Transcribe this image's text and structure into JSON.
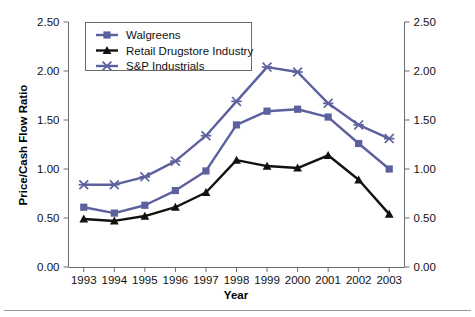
{
  "chart_data": {
    "type": "line",
    "title": "",
    "xlabel": "Year",
    "ylabel": "Price/Cash Flow Ratio",
    "categories": [
      "1993",
      "1994",
      "1995",
      "1996",
      "1997",
      "1998",
      "1999",
      "2000",
      "2001",
      "2002",
      "2003"
    ],
    "x": [
      1993,
      1994,
      1995,
      1996,
      1997,
      1998,
      1999,
      2000,
      2001,
      2002,
      2003
    ],
    "ylim": [
      0.0,
      2.5
    ],
    "yticks": [
      "0.00",
      "0.50",
      "1.00",
      "1.50",
      "2.00",
      "2.50"
    ],
    "ytick_values": [
      0.0,
      0.5,
      1.0,
      1.5,
      2.0,
      2.5
    ],
    "right_axis": true,
    "right_yticks": [
      "0.00",
      "0.50",
      "1.00",
      "1.50",
      "2.00",
      "2.50"
    ],
    "grid": false,
    "legend_position": "top-left",
    "series": [
      {
        "name": "Walgreens",
        "marker": "square",
        "color": "#5c619e",
        "values": [
          0.61,
          0.55,
          0.63,
          0.78,
          0.98,
          1.45,
          1.59,
          1.61,
          1.53,
          1.26,
          1.0
        ]
      },
      {
        "name": "Retail Drugstore Industry",
        "marker": "triangle",
        "color": "#111111",
        "values": [
          0.49,
          0.47,
          0.52,
          0.61,
          0.76,
          1.09,
          1.03,
          1.01,
          1.14,
          0.89,
          0.54
        ]
      },
      {
        "name": "S&P Industrials",
        "marker": "x",
        "color": "#5c619e",
        "values": [
          0.84,
          0.84,
          0.92,
          1.08,
          1.34,
          1.69,
          2.04,
          1.99,
          1.67,
          1.45,
          1.31
        ]
      }
    ]
  },
  "legend": {
    "entries": [
      {
        "label": "Walgreens"
      },
      {
        "label": "Retail Drugstore Industry"
      },
      {
        "label": "S&P Industrials"
      }
    ]
  },
  "axes": {
    "y_left_title": "Price/Cash Flow Ratio",
    "x_title": "Year"
  }
}
